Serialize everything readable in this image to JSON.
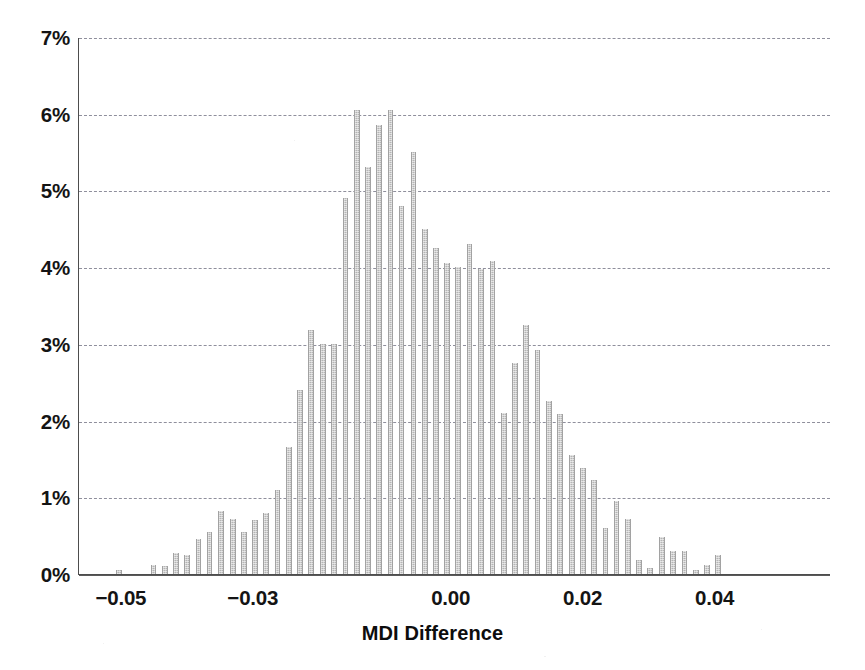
{
  "chart_data": {
    "type": "bar",
    "subtype": "histogram",
    "title": "",
    "xlabel": "MDI Difference",
    "ylabel": "",
    "xlim": [
      -0.0565,
      0.0575
    ],
    "ylim": [
      0,
      7
    ],
    "y_unit": "%",
    "grid": true,
    "grid_axis": "y",
    "grid_style": "dashed",
    "legend": "none",
    "bar_color": "#b5b5b5",
    "axis_color": "#4d4d4d",
    "grid_color": "#8f8f9c",
    "bin_width": 0.001714,
    "xticks": [
      -0.05,
      -0.03,
      0.0,
      0.02,
      0.04
    ],
    "xtick_labels": [
      "−0.05",
      "−0.03",
      "0.00",
      "0.02",
      "0.04"
    ],
    "yticks": [
      0,
      1,
      2,
      3,
      4,
      5,
      6,
      7
    ],
    "ytick_labels": [
      "0%",
      "1%",
      "2%",
      "3%",
      "4%",
      "5%",
      "6%",
      "7%"
    ],
    "x": [
      -0.0555,
      -0.0538,
      -0.0521,
      -0.0504,
      -0.0487,
      -0.0469,
      -0.0452,
      -0.0435,
      -0.0418,
      -0.0401,
      -0.0384,
      -0.0367,
      -0.035,
      -0.0332,
      -0.0315,
      -0.0298,
      -0.0281,
      -0.0264,
      -0.0247,
      -0.023,
      -0.0213,
      -0.0195,
      -0.0178,
      -0.0161,
      -0.0144,
      -0.0127,
      -0.011,
      -0.0093,
      -0.0076,
      -0.0058,
      -0.0041,
      -0.0024,
      -0.0007,
      0.001,
      0.0027,
      0.0044,
      0.0062,
      0.0079,
      0.0096,
      0.0113,
      0.013,
      0.0147,
      0.0164,
      0.0182,
      0.0199,
      0.0216,
      0.0233,
      0.025,
      0.0267,
      0.0284,
      0.0301,
      0.0319,
      0.0336,
      0.0353,
      0.037,
      0.0387,
      0.0404,
      0.0421,
      0.0438,
      0.0456,
      0.0473,
      0.049,
      0.0507,
      0.0524,
      0.0541,
      0.0558
    ],
    "values": [
      0.0,
      0.0,
      0.0,
      0.05,
      0.0,
      0.0,
      0.12,
      0.1,
      0.28,
      0.25,
      0.45,
      0.55,
      0.82,
      0.72,
      0.55,
      0.7,
      0.8,
      1.1,
      1.65,
      2.4,
      3.18,
      3.0,
      3.0,
      4.9,
      6.05,
      5.3,
      5.85,
      6.05,
      4.8,
      5.5,
      4.5,
      4.25,
      4.05,
      4.0,
      4.3,
      3.98,
      4.08,
      2.1,
      2.75,
      3.25,
      2.92,
      2.25,
      2.08,
      1.55,
      1.38,
      1.22,
      0.6,
      0.95,
      0.72,
      0.18,
      0.08,
      0.48,
      0.3,
      0.3,
      0.05,
      0.12,
      0.25,
      0.0,
      0.0,
      0.0,
      0.0,
      0.0,
      0.0,
      0.0,
      0.0,
      0.0
    ],
    "bars": [
      {
        "x": -0.0504,
        "value": 0.05
      },
      {
        "x": -0.0452,
        "value": 0.12
      },
      {
        "x": -0.0435,
        "value": 0.1
      },
      {
        "x": -0.0418,
        "value": 0.28
      },
      {
        "x": -0.0401,
        "value": 0.25
      },
      {
        "x": -0.0384,
        "value": 0.45
      },
      {
        "x": -0.0367,
        "value": 0.55
      },
      {
        "x": -0.035,
        "value": 0.82
      },
      {
        "x": -0.0332,
        "value": 0.72
      },
      {
        "x": -0.0315,
        "value": 0.55
      },
      {
        "x": -0.0298,
        "value": 0.7
      },
      {
        "x": -0.0281,
        "value": 0.8
      },
      {
        "x": -0.0264,
        "value": 1.1
      },
      {
        "x": -0.0247,
        "value": 1.65
      },
      {
        "x": -0.023,
        "value": 2.4
      },
      {
        "x": -0.0213,
        "value": 3.18
      },
      {
        "x": -0.0195,
        "value": 3.0
      },
      {
        "x": -0.0178,
        "value": 3.0
      },
      {
        "x": -0.0161,
        "value": 4.9
      },
      {
        "x": -0.0144,
        "value": 6.05
      },
      {
        "x": -0.0127,
        "value": 5.3
      },
      {
        "x": -0.011,
        "value": 5.85
      },
      {
        "x": -0.0093,
        "value": 6.05
      },
      {
        "x": -0.0076,
        "value": 4.8
      },
      {
        "x": -0.0058,
        "value": 5.5
      },
      {
        "x": -0.0041,
        "value": 4.5
      },
      {
        "x": -0.0024,
        "value": 4.25
      },
      {
        "x": -0.0007,
        "value": 4.05
      },
      {
        "x": 0.001,
        "value": 4.0
      },
      {
        "x": 0.0027,
        "value": 4.3
      },
      {
        "x": 0.0044,
        "value": 3.98
      },
      {
        "x": 0.0062,
        "value": 4.08
      },
      {
        "x": 0.0079,
        "value": 2.1
      },
      {
        "x": 0.0096,
        "value": 2.75
      },
      {
        "x": 0.0113,
        "value": 3.25
      },
      {
        "x": 0.013,
        "value": 2.92
      },
      {
        "x": 0.0147,
        "value": 2.25
      },
      {
        "x": 0.0164,
        "value": 2.08
      },
      {
        "x": 0.0182,
        "value": 1.55
      },
      {
        "x": 0.0199,
        "value": 1.38
      },
      {
        "x": 0.0216,
        "value": 1.22
      },
      {
        "x": 0.0233,
        "value": 0.6
      },
      {
        "x": 0.025,
        "value": 0.95
      },
      {
        "x": 0.0267,
        "value": 0.72
      },
      {
        "x": 0.0284,
        "value": 0.18
      },
      {
        "x": 0.0301,
        "value": 0.08
      },
      {
        "x": 0.0319,
        "value": 0.48
      },
      {
        "x": 0.0336,
        "value": 0.3
      },
      {
        "x": 0.0353,
        "value": 0.3
      },
      {
        "x": 0.037,
        "value": 0.05
      },
      {
        "x": 0.0387,
        "value": 0.12
      },
      {
        "x": 0.0404,
        "value": 0.25
      }
    ]
  }
}
